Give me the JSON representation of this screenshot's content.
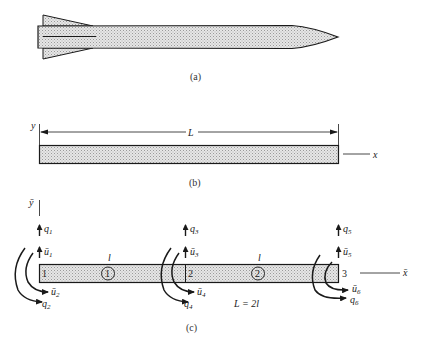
{
  "figure": {
    "colors": {
      "line": "#1a1a1a",
      "fill": "#d8d8d8",
      "text": "#222222"
    },
    "panel_a": {
      "caption": "(a)",
      "subject": "rocket-outline"
    },
    "panel_b": {
      "caption": "(b)",
      "y_axis_label": "y",
      "x_axis_label": "x",
      "length_label": "L"
    },
    "panel_c": {
      "caption": "(c)",
      "y_axis_label": "ȳ",
      "x_axis_label": "x̄",
      "length_relation": "L = 2l",
      "nodes": [
        {
          "id": "1",
          "force_global": "q",
          "force_global_sub": "1",
          "force_local": "ū",
          "force_local_sub": "1",
          "moment_global": "q",
          "moment_global_sub": "2",
          "moment_local": "ū",
          "moment_local_sub": "2"
        },
        {
          "id": "2",
          "force_global": "q",
          "force_global_sub": "3",
          "force_local": "ū",
          "force_local_sub": "3",
          "moment_global": "q",
          "moment_global_sub": "4",
          "moment_local": "ū",
          "moment_local_sub": "4"
        },
        {
          "id": "3",
          "force_global": "q",
          "force_global_sub": "5",
          "force_local": "ū",
          "force_local_sub": "5",
          "moment_global": "q",
          "moment_global_sub": "6",
          "moment_local": "ū",
          "moment_local_sub": "6"
        }
      ],
      "elements": [
        {
          "id": "1",
          "length_label": "l"
        },
        {
          "id": "2",
          "length_label": "l"
        }
      ]
    }
  }
}
